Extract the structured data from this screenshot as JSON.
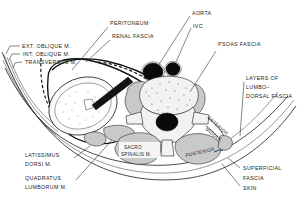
{
  "figure": {
    "type": "anatomical-cross-section",
    "region": "lumbar retroperitoneum transverse section",
    "background_color": "#ffffff",
    "ink_color": "#1a1a1a",
    "muscle_fill": "#c9c9c9",
    "bone_fill": "#f2f2f2",
    "vessel_fill": "#0a0a0a"
  },
  "labels": {
    "ext_oblique": "EXT. OBLIQUE M.",
    "int_oblique": "INT. OBLIQUE M.",
    "transversus": "TRANSVERSUS M.",
    "peritoneum": "PERITONEUM",
    "renal_fascia": "RENAL FASCIA",
    "aorta": "AORTA",
    "ivc": "IVC",
    "psoas_fascia": "PSOAS FASCIA",
    "layers_line1": "LAYERS OF",
    "layers_line2": "LUMBO–",
    "layers_line3": "DORSAL FASCIA",
    "anterior": "ANTERIOR",
    "middle": "MIDDLE",
    "posterior": "POSTERIOR",
    "sacro_line1": "SACRO",
    "sacro_line2": "SPINALIS M.",
    "latissimus_line1": "LATISSIMUS",
    "latissimus_line2": "DORSI  M.",
    "quadratus_line1": "QUADRATUS",
    "quadratus_line2": "LUMBORUM M.",
    "superficial": "SUPERFICIAL",
    "fascia": "FASCIA",
    "skin": "SKIN"
  },
  "structures": [
    {
      "name": "skin",
      "kind": "boundary"
    },
    {
      "name": "superficial-fascia",
      "kind": "boundary"
    },
    {
      "name": "lumbodorsal-fascia",
      "kind": "fascia",
      "layers": [
        "ANTERIOR",
        "MIDDLE",
        "POSTERIOR"
      ]
    },
    {
      "name": "peritoneum",
      "kind": "membrane"
    },
    {
      "name": "renal-fascia",
      "kind": "fascia"
    },
    {
      "name": "psoas-fascia",
      "kind": "fascia"
    },
    {
      "name": "kidney",
      "kind": "organ"
    },
    {
      "name": "aorta",
      "kind": "vessel"
    },
    {
      "name": "inferior-vena-cava",
      "kind": "vessel"
    },
    {
      "name": "vertebral-body",
      "kind": "bone"
    },
    {
      "name": "spinal-canal",
      "kind": "canal"
    },
    {
      "name": "psoas-major-muscle",
      "kind": "muscle"
    },
    {
      "name": "quadratus-lumborum-muscle",
      "kind": "muscle"
    },
    {
      "name": "sacrospinalis-muscle",
      "kind": "muscle"
    },
    {
      "name": "latissimus-dorsi-muscle",
      "kind": "muscle"
    },
    {
      "name": "external-oblique-muscle",
      "kind": "muscle"
    },
    {
      "name": "internal-oblique-muscle",
      "kind": "muscle"
    },
    {
      "name": "transversus-abdominis-muscle",
      "kind": "muscle"
    }
  ]
}
